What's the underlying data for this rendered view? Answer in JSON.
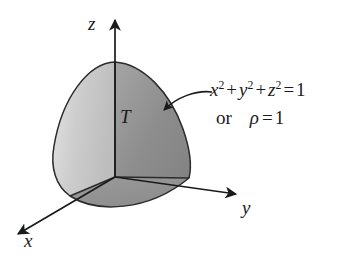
{
  "figure": {
    "background_color": "#ffffff",
    "ink_color": "#1a1a1a",
    "width": 363,
    "height": 259
  },
  "axes": [
    {
      "name": "z",
      "label": "z",
      "direction": "up",
      "arrow_tip": [
        115,
        14
      ],
      "origin": [
        115,
        177
      ]
    },
    {
      "name": "y",
      "label": "y",
      "direction": "down-right",
      "arrow_tip": [
        240,
        196
      ],
      "origin": [
        115,
        177
      ]
    },
    {
      "name": "x",
      "label": "x",
      "direction": "down-left",
      "arrow_tip": [
        13,
        237
      ],
      "origin": [
        115,
        177
      ]
    }
  ],
  "solid": {
    "region_label": "T",
    "description": "one octant of the unit sphere",
    "apex": [
      115,
      62
    ],
    "origin": [
      115,
      177
    ],
    "radius_px": 115,
    "face_light_color": "#c9c9c9",
    "face_dark_color": "#8d8d8d",
    "outline_color": "#2b2b2b"
  },
  "annotation": {
    "equation": {
      "x_term": "x",
      "y_term": "y",
      "z_term": "z",
      "exponent": "2",
      "plus": "+",
      "equals": "=",
      "result": "1"
    },
    "alternative": {
      "or_word": "or",
      "symbol": "ρ",
      "equals": "=",
      "result": "1"
    },
    "pointer": {
      "name": "curved-arrow",
      "from": [
        212,
        92
      ],
      "to": [
        160,
        112
      ]
    }
  }
}
